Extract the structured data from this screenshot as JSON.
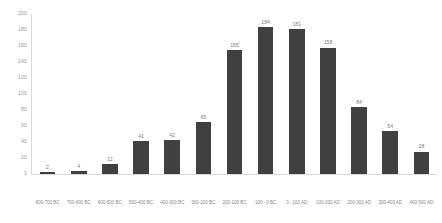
{
  "chart_data": {
    "type": "bar",
    "title": "",
    "subtitle": "",
    "xlabel": "",
    "ylabel": "",
    "ylim": [
      0,
      200
    ],
    "grid": false,
    "legend": false,
    "legend_position": "none",
    "bar_color": "#404040",
    "label_color": "#808080",
    "axis_color": "#d9d9d9",
    "y_ticks": [
      200,
      180,
      160,
      140,
      120,
      100,
      80,
      60,
      40,
      20,
      0
    ],
    "categories": [
      "800-700 BC",
      "700-600 BC",
      "600-500 BC",
      "500-400 BC",
      "400-300 BC",
      "300-200 BC",
      "200-100 BC",
      "100 - 0 BC",
      "0 - 100 AD",
      "100-200 AD",
      "200-300 AD",
      "300-400 AD",
      "400-500 AD"
    ],
    "values": [
      2,
      4,
      12,
      41,
      42,
      65,
      155,
      184,
      181,
      158,
      84,
      54,
      28
    ]
  }
}
